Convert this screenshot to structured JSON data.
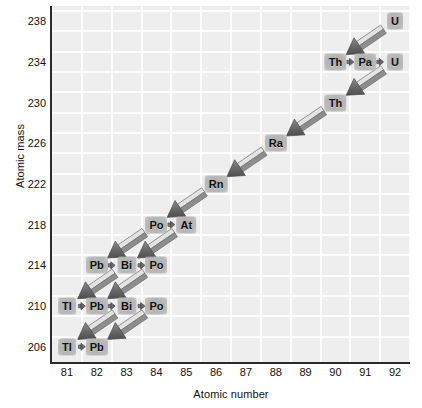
{
  "chart_data": {
    "type": "scatter",
    "title": "",
    "xlabel": "Atomic number",
    "ylabel": "Atomic mass",
    "xlim": [
      80.5,
      92.5
    ],
    "ylim": [
      204.5,
      239.5
    ],
    "xticks": [
      81,
      82,
      83,
      84,
      85,
      86,
      87,
      88,
      89,
      90,
      91,
      92
    ],
    "yticks": [
      206,
      210,
      214,
      218,
      222,
      226,
      230,
      234,
      238
    ],
    "grid": true,
    "legend": "none",
    "points": [
      {
        "label": "U",
        "x": 92,
        "y": 238
      },
      {
        "label": "Th",
        "x": 90,
        "y": 234
      },
      {
        "label": "Pa",
        "x": 91,
        "y": 234
      },
      {
        "label": "U",
        "x": 92,
        "y": 234
      },
      {
        "label": "Th",
        "x": 90,
        "y": 230
      },
      {
        "label": "Ra",
        "x": 88,
        "y": 226
      },
      {
        "label": "Rn",
        "x": 86,
        "y": 222
      },
      {
        "label": "Po",
        "x": 84,
        "y": 218
      },
      {
        "label": "At",
        "x": 85,
        "y": 218
      },
      {
        "label": "Pb",
        "x": 82,
        "y": 214
      },
      {
        "label": "Bi",
        "x": 83,
        "y": 214
      },
      {
        "label": "Po",
        "x": 84,
        "y": 214
      },
      {
        "label": "Tl",
        "x": 81,
        "y": 210
      },
      {
        "label": "Pb",
        "x": 82,
        "y": 210
      },
      {
        "label": "Bi",
        "x": 83,
        "y": 210
      },
      {
        "label": "Po",
        "x": 84,
        "y": 210
      },
      {
        "label": "Tl",
        "x": 81,
        "y": 206
      },
      {
        "label": "Pb",
        "x": 82,
        "y": 206
      }
    ],
    "alpha_decays": [
      {
        "from": [
          92,
          238
        ],
        "to": [
          90,
          234
        ]
      },
      {
        "from": [
          92,
          234
        ],
        "to": [
          90,
          230
        ]
      },
      {
        "from": [
          90,
          230
        ],
        "to": [
          88,
          226
        ]
      },
      {
        "from": [
          88,
          226
        ],
        "to": [
          86,
          222
        ]
      },
      {
        "from": [
          86,
          222
        ],
        "to": [
          84,
          218
        ]
      },
      {
        "from": [
          85,
          218
        ],
        "to": [
          83,
          214
        ]
      },
      {
        "from": [
          84,
          218
        ],
        "to": [
          82,
          214
        ]
      },
      {
        "from": [
          84,
          214
        ],
        "to": [
          82,
          210
        ]
      },
      {
        "from": [
          83,
          214
        ],
        "to": [
          81,
          210
        ]
      },
      {
        "from": [
          84,
          210
        ],
        "to": [
          82,
          206
        ]
      },
      {
        "from": [
          83,
          210
        ],
        "to": [
          81,
          206
        ]
      }
    ],
    "beta_decays": [
      {
        "from": [
          90,
          234
        ],
        "to": [
          91,
          234
        ]
      },
      {
        "from": [
          91,
          234
        ],
        "to": [
          92,
          234
        ]
      },
      {
        "from": [
          84,
          218
        ],
        "to": [
          85,
          218
        ]
      },
      {
        "from": [
          82,
          214
        ],
        "to": [
          83,
          214
        ]
      },
      {
        "from": [
          83,
          214
        ],
        "to": [
          84,
          214
        ]
      },
      {
        "from": [
          81,
          210
        ],
        "to": [
          82,
          210
        ]
      },
      {
        "from": [
          82,
          210
        ],
        "to": [
          83,
          210
        ]
      },
      {
        "from": [
          83,
          210
        ],
        "to": [
          84,
          210
        ]
      },
      {
        "from": [
          81,
          206
        ],
        "to": [
          82,
          206
        ]
      }
    ]
  },
  "axes": {
    "x_title": "Atomic number",
    "y_title": "Atomic mass",
    "x_tick_labels": [
      "81",
      "82",
      "83",
      "84",
      "85",
      "86",
      "87",
      "88",
      "89",
      "90",
      "91",
      "92"
    ],
    "y_tick_labels": [
      "238",
      "234",
      "230",
      "226",
      "222",
      "218",
      "214",
      "210",
      "206"
    ]
  },
  "colors": {
    "plot_background": "#eeeeee",
    "gridline": "#fdfdfd",
    "axis_line": "#2b2b2b",
    "arrow_dark": "#6e6e6e",
    "arrow_light": "#d8d8d8",
    "text": "#111111"
  }
}
